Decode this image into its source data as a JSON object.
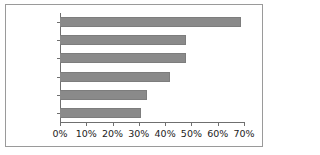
{
  "chart_data": {
    "type": "bar",
    "orientation": "horizontal",
    "title": "",
    "xlabel": "",
    "ylabel": "",
    "categories": [
      "Canada",
      "France",
      "Australia",
      "USA",
      "UK",
      "Belgium"
    ],
    "values": [
      69,
      48,
      48,
      42,
      33,
      31
    ],
    "value_format": "percent",
    "xlim": [
      0,
      70
    ],
    "xticks": [
      0,
      10,
      20,
      30,
      40,
      50,
      60,
      70
    ],
    "xticklabels": [
      "0%",
      "10%",
      "20%",
      "30%",
      "40%",
      "50%",
      "60%",
      "70%"
    ],
    "grid": false,
    "legend": false,
    "bar_color": "#8a8a8a",
    "axis_color": "#6f6f6f",
    "frame_color": "#9a9a9a",
    "text_color": "#222222"
  }
}
